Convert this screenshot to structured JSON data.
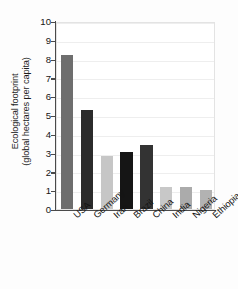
{
  "chart_data": {
    "type": "bar",
    "title": "",
    "subtitle": "",
    "xlabel": "",
    "ylabel": "Ecological footprint (global hectares per capita)",
    "ylabel_line1": "Ecological footprint",
    "ylabel_line2": "(global hectares per capita)",
    "categories": [
      "USA",
      "Germany",
      "Iran",
      "Brazil",
      "China",
      "India",
      "Nigeria",
      "Ethiopia"
    ],
    "values": [
      8.2,
      5.25,
      2.8,
      3.05,
      3.4,
      1.15,
      1.15,
      1.0
    ],
    "bar_colors": [
      "#6e6e6e",
      "#2b2b2b",
      "#c6c6c6",
      "#151515",
      "#333333",
      "#c8c8c8",
      "#ababab",
      "#b2b2b2"
    ],
    "ylim": [
      0,
      10
    ],
    "ytick_labels": [
      "10",
      "9",
      "8",
      "7",
      "6",
      "5",
      "4",
      "3",
      "2",
      "1",
      "0"
    ],
    "ytick_values": [
      10,
      9,
      8,
      7,
      6,
      5,
      4,
      3,
      2,
      1,
      0
    ],
    "grid": true,
    "grid_axis": "y",
    "legend": false,
    "legend_position": "none",
    "axis_color": "#4a4a4a",
    "grid_color": "#eeeeee",
    "background": "#ffffff"
  }
}
